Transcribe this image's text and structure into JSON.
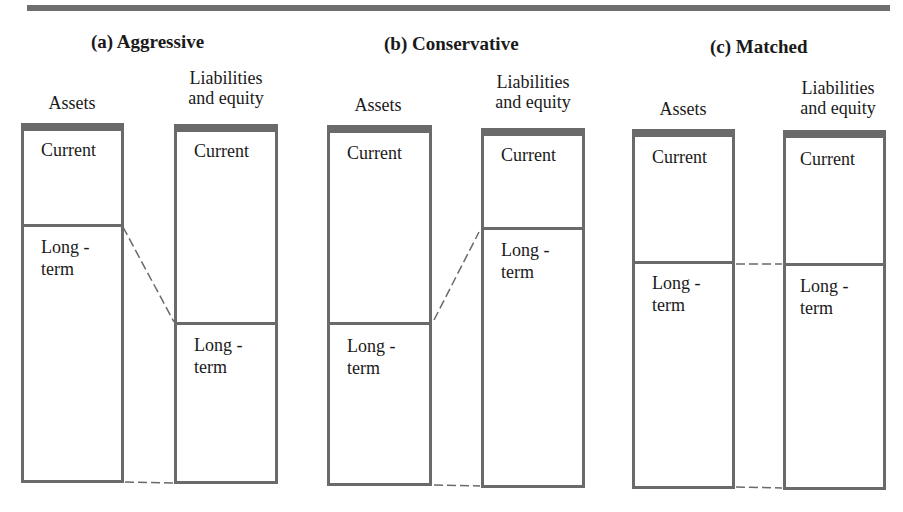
{
  "figure": {
    "panels": [
      {
        "id": "a",
        "title": "(a) Aggressive",
        "assets": {
          "header": "Assets",
          "segments": [
            {
              "label_line1": "Current",
              "label_line2": ""
            },
            {
              "label_line1": "Long -",
              "label_line2": "term"
            }
          ]
        },
        "liabilities": {
          "header_line1": "Liabilities",
          "header_line2": "and equity",
          "segments": [
            {
              "label_line1": "Current",
              "label_line2": ""
            },
            {
              "label_line1": "Long -",
              "label_line2": "term"
            }
          ]
        }
      },
      {
        "id": "b",
        "title": "(b) Conservative",
        "assets": {
          "header": "Assets",
          "segments": [
            {
              "label_line1": "Current",
              "label_line2": ""
            },
            {
              "label_line1": "Long -",
              "label_line2": "term"
            }
          ]
        },
        "liabilities": {
          "header_line1": "Liabilities",
          "header_line2": "and equity",
          "segments": [
            {
              "label_line1": "Current",
              "label_line2": ""
            },
            {
              "label_line1": "Long -",
              "label_line2": "term"
            }
          ]
        }
      },
      {
        "id": "c",
        "title": "(c) Matched",
        "assets": {
          "header": "Assets",
          "segments": [
            {
              "label_line1": "Current",
              "label_line2": ""
            },
            {
              "label_line1": "Long -",
              "label_line2": "term"
            }
          ]
        },
        "liabilities": {
          "header_line1": "Liabilities",
          "header_line2": "and equity",
          "segments": [
            {
              "label_line1": "Current",
              "label_line2": ""
            },
            {
              "label_line1": "Long -",
              "label_line2": "term"
            }
          ]
        }
      }
    ],
    "colors": {
      "rule": "#6e6e6e",
      "box_border": "#6a6a6a",
      "text": "#1a1a1a",
      "background": "#ffffff"
    }
  }
}
